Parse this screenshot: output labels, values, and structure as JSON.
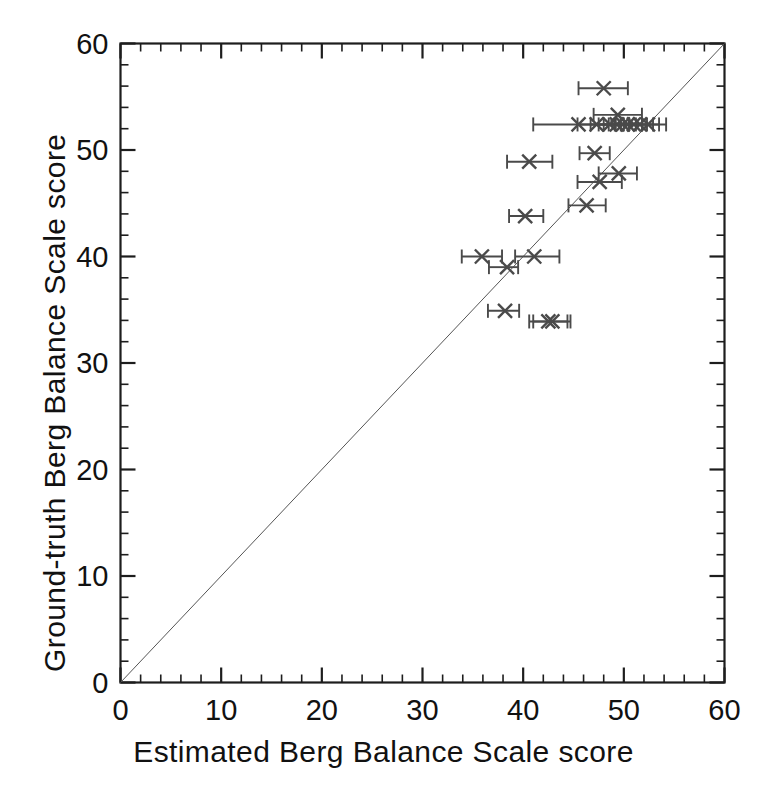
{
  "chart_data": {
    "type": "scatter",
    "title": "",
    "xlabel": "Estimated Berg Balance Scale score",
    "ylabel": "Ground-truth Berg Balance Scale score",
    "xlim": [
      0,
      60
    ],
    "ylim": [
      0,
      60
    ],
    "xticks": [
      0,
      10,
      20,
      30,
      40,
      50,
      60
    ],
    "yticks": [
      0,
      10,
      20,
      30,
      40,
      50,
      60
    ],
    "xtick_labels": [
      "0",
      "10",
      "20",
      "30",
      "40",
      "50",
      "60"
    ],
    "ytick_labels": [
      "0",
      "10",
      "20",
      "30",
      "40",
      "50",
      "60"
    ],
    "minor_tick_interval": 2,
    "grid": false,
    "legend": null,
    "legend_position": "none",
    "marker": "x",
    "marker_color": "#4a4a4a",
    "errorbar_color": "#4a4a4a",
    "identity_line": {
      "label": "y = x reference line",
      "from": [
        0,
        0
      ],
      "to": [
        60,
        60
      ],
      "color": "#555555",
      "width": 1
    },
    "error_direction": "x",
    "points": [
      {
        "x": 48.0,
        "y": 55.8,
        "xerr_low": 45.5,
        "xerr_high": 50.4
      },
      {
        "x": 49.4,
        "y": 53.3,
        "xerr_low": 47.0,
        "xerr_high": 51.8
      },
      {
        "x": 45.5,
        "y": 52.4,
        "xerr_low": 41.0,
        "xerr_high": 50.0
      },
      {
        "x": 47.3,
        "y": 52.4,
        "xerr_low": 45.4,
        "xerr_high": 49.2
      },
      {
        "x": 48.6,
        "y": 52.4,
        "xerr_low": 46.7,
        "xerr_high": 50.5
      },
      {
        "x": 49.3,
        "y": 52.4,
        "xerr_low": 47.5,
        "xerr_high": 51.2
      },
      {
        "x": 49.9,
        "y": 52.4,
        "xerr_low": 48.0,
        "xerr_high": 51.8
      },
      {
        "x": 50.4,
        "y": 52.4,
        "xerr_low": 48.5,
        "xerr_high": 52.3
      },
      {
        "x": 51.0,
        "y": 52.4,
        "xerr_low": 49.1,
        "xerr_high": 52.9
      },
      {
        "x": 51.6,
        "y": 52.4,
        "xerr_low": 49.7,
        "xerr_high": 53.5
      },
      {
        "x": 52.4,
        "y": 52.4,
        "xerr_low": 50.5,
        "xerr_high": 54.2
      },
      {
        "x": 47.1,
        "y": 49.7,
        "xerr_low": 45.6,
        "xerr_high": 48.6
      },
      {
        "x": 40.6,
        "y": 48.9,
        "xerr_low": 38.4,
        "xerr_high": 42.9
      },
      {
        "x": 49.5,
        "y": 47.8,
        "xerr_low": 47.5,
        "xerr_high": 51.3
      },
      {
        "x": 47.6,
        "y": 47.0,
        "xerr_low": 45.4,
        "xerr_high": 49.8
      },
      {
        "x": 46.3,
        "y": 44.8,
        "xerr_low": 44.5,
        "xerr_high": 48.2
      },
      {
        "x": 40.2,
        "y": 43.8,
        "xerr_low": 38.6,
        "xerr_high": 42.0
      },
      {
        "x": 35.9,
        "y": 40.0,
        "xerr_low": 33.9,
        "xerr_high": 37.9
      },
      {
        "x": 41.1,
        "y": 40.0,
        "xerr_low": 39.2,
        "xerr_high": 43.6
      },
      {
        "x": 38.4,
        "y": 39.0,
        "xerr_low": 36.6,
        "xerr_high": 39.5
      },
      {
        "x": 38.2,
        "y": 34.9,
        "xerr_low": 36.5,
        "xerr_high": 39.6
      },
      {
        "x": 42.5,
        "y": 33.9,
        "xerr_low": 40.6,
        "xerr_high": 44.4
      },
      {
        "x": 42.9,
        "y": 33.9,
        "xerr_low": 41.0,
        "xerr_high": 44.7
      }
    ]
  },
  "axes": {
    "x_label": "Estimated Berg Balance Scale score",
    "y_label": "Ground-truth Berg Balance Scale score"
  }
}
